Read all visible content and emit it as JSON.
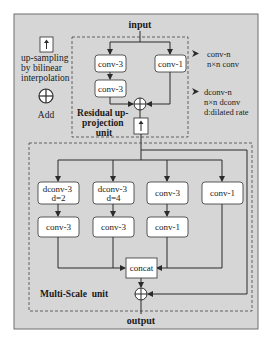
{
  "diagram": {
    "colors": {
      "panel_bg": "#d6d6d6",
      "panel_border": "#6e6e6e",
      "box_fill": "#ffffff",
      "line": "#2b2b2b"
    },
    "io": {
      "input": "input",
      "output": "output"
    },
    "legend_left": {
      "upsample_lines": [
        "up-sampling",
        "by bilinear",
        "interpolation"
      ],
      "add_label": "Add"
    },
    "legend_right": {
      "conv_lines": [
        "conv-n",
        "n×n conv"
      ],
      "dconv_lines": [
        "dconv-n",
        "n×n dconv",
        "d:dilated rate"
      ]
    },
    "residual_unit": {
      "label_lines": [
        "Residual up-",
        "projection",
        "unit"
      ],
      "left_branch": [
        "conv-3",
        "conv-3"
      ],
      "right_branch": [
        "conv-1"
      ]
    },
    "multiscale_unit": {
      "label": "Multi-Scale  unit",
      "top_row": [
        {
          "line1": "dconv-3",
          "line2": "d=2"
        },
        {
          "line1": "dconv-3",
          "line2": "d=4"
        },
        {
          "line1": "conv-3",
          "line2": ""
        },
        {
          "line1": "conv-1",
          "line2": ""
        }
      ],
      "second_row": [
        "conv-3",
        "conv-3",
        "conv-1"
      ],
      "concat": "concat"
    }
  }
}
